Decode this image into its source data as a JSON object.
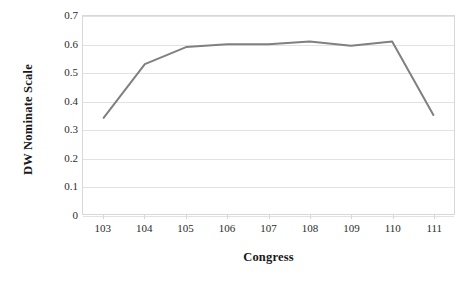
{
  "chart_data": {
    "type": "line",
    "title": "",
    "subtitle": "",
    "xlabel": "Congress",
    "ylabel": "DW Nominate Scale",
    "categories": [
      "103",
      "104",
      "105",
      "106",
      "107",
      "108",
      "109",
      "110",
      "111"
    ],
    "values": [
      0.34,
      0.53,
      0.59,
      0.6,
      0.6,
      0.61,
      0.595,
      0.61,
      0.35
    ],
    "series": [
      {
        "name": "DW Nominate Scale",
        "values": [
          0.34,
          0.53,
          0.59,
          0.6,
          0.6,
          0.61,
          0.595,
          0.61,
          0.35
        ],
        "color": "#808080"
      }
    ],
    "ylim": [
      0,
      0.7
    ],
    "ytick_values": [
      0,
      0.1,
      0.2,
      0.3,
      0.4,
      0.5,
      0.6,
      0.7
    ],
    "ytick_labels": [
      "0",
      "0.1",
      "0.2",
      "0.3",
      "0.4",
      "0.5",
      "0.6",
      "0.7"
    ],
    "xtick_labels": [
      "103",
      "104",
      "105",
      "106",
      "107",
      "108",
      "109",
      "110",
      "111"
    ],
    "grid": "horizontal",
    "legend": "none",
    "markers": "none",
    "line_color": "#808080",
    "line_width": 2,
    "gridline_color": "#e2e2e2",
    "plot_border_color": "#d8d8d8",
    "background_color": "#ffffff",
    "text_color": "#2b2b2b",
    "axis_title_color": "#181818"
  }
}
